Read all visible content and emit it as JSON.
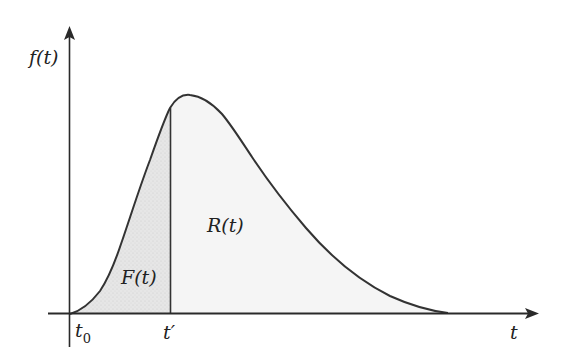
{
  "diagram": {
    "type": "probability-density-curve",
    "y_axis_label": "f(t)",
    "x_axis_label": "t",
    "tick_labels": {
      "start": "t",
      "start_subscript": "0",
      "split": "t′"
    },
    "regions": [
      {
        "name": "F",
        "label": "F(t)",
        "description": "area under f(t) from t0 to t′"
      },
      {
        "name": "R",
        "label": "R(t)",
        "description": "area under f(t) from t′ onward"
      }
    ],
    "colors": {
      "axis": "#2a2a2a",
      "curve": "#333333",
      "fill_F": "#e3e3e3",
      "fill_R": "#f5f5f5"
    }
  }
}
